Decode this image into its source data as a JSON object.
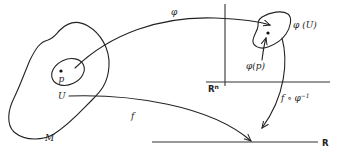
{
  "diagram": {
    "type": "manifold-chart-map",
    "labels": {
      "manifold": "M",
      "open_set": "U",
      "point": "p",
      "chart_map": "φ",
      "image_set": "φ (U)",
      "image_point": "φ(p)",
      "euclidean_space": "R",
      "euclidean_space_exp": "n",
      "function": "f",
      "composition": "f ∘ φ",
      "composition_exp": "−1",
      "real_line": "R"
    },
    "colors": {
      "ink": "#222222",
      "background": "#ffffff"
    }
  }
}
